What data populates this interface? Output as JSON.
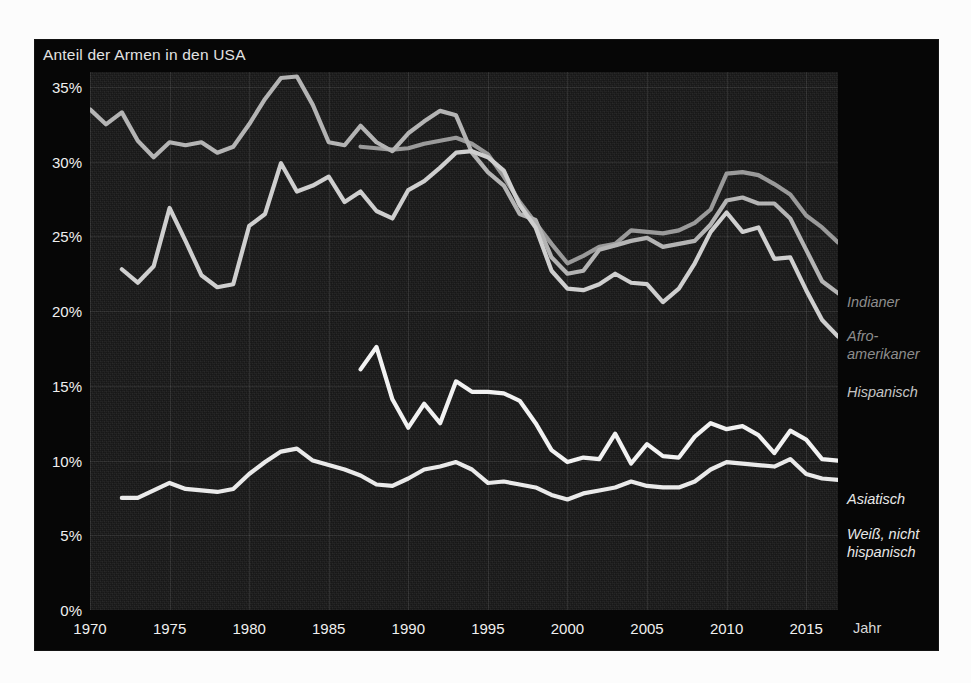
{
  "chart_data": {
    "type": "line",
    "title": "Anteil der Armen in den USA",
    "xlabel": "Jahr",
    "ylabel": "",
    "xlim": [
      1970,
      2017
    ],
    "ylim": [
      0,
      36
    ],
    "grid": true,
    "legend_position": "right",
    "ytick_labels": [
      "0%",
      "5%",
      "10%",
      "15%",
      "20%",
      "25%",
      "30%",
      "35%"
    ],
    "ytick_values": [
      0,
      5,
      10,
      15,
      20,
      25,
      30,
      35
    ],
    "xtick_labels": [
      "1970",
      "1975",
      "1980",
      "1985",
      "1990",
      "1995",
      "2000",
      "2005",
      "2010",
      "2015"
    ],
    "xtick_values": [
      1970,
      1975,
      1980,
      1985,
      1990,
      1995,
      2000,
      2005,
      2010,
      2015
    ],
    "series": [
      {
        "name": "Indianer",
        "color": "#9a9a9a",
        "label_color": "#8d8d8d",
        "x": [
          1987,
          1988,
          1989,
          1990,
          1991,
          1992,
          1993,
          1994,
          1995,
          1996,
          1997,
          1998,
          1999,
          2000,
          2001,
          2002,
          2003,
          2004,
          2005,
          2006,
          2007,
          2008,
          2009,
          2010,
          2011,
          2012,
          2013,
          2014,
          2015,
          2016,
          2017
        ],
        "values": [
          31.0,
          30.9,
          30.8,
          30.9,
          31.2,
          31.4,
          31.6,
          31.2,
          30.5,
          29.0,
          27.3,
          25.9,
          24.5,
          23.2,
          23.7,
          24.3,
          24.5,
          25.4,
          25.3,
          25.2,
          25.4,
          25.9,
          26.8,
          29.2,
          29.3,
          29.1,
          28.5,
          27.8,
          26.4,
          25.6,
          24.6
        ]
      },
      {
        "name": "Afro-amerikaner",
        "color": "#b4b4b4",
        "label_color": "#8d8d8d",
        "x": [
          1970,
          1971,
          1972,
          1973,
          1974,
          1975,
          1976,
          1977,
          1978,
          1979,
          1980,
          1981,
          1982,
          1983,
          1984,
          1985,
          1986,
          1987,
          1988,
          1989,
          1990,
          1991,
          1992,
          1993,
          1994,
          1995,
          1996,
          1997,
          1998,
          1999,
          2000,
          2001,
          2002,
          2003,
          2004,
          2005,
          2006,
          2007,
          2008,
          2009,
          2010,
          2011,
          2012,
          2013,
          2014,
          2015,
          2016,
          2017
        ],
        "values": [
          33.5,
          32.5,
          33.3,
          31.4,
          30.3,
          31.3,
          31.1,
          31.3,
          30.6,
          31.0,
          32.5,
          34.2,
          35.6,
          35.7,
          33.8,
          31.3,
          31.1,
          32.4,
          31.3,
          30.7,
          31.9,
          32.7,
          33.4,
          33.1,
          30.6,
          29.3,
          28.4,
          26.5,
          26.1,
          23.6,
          22.5,
          22.7,
          24.1,
          24.4,
          24.7,
          24.9,
          24.3,
          24.5,
          24.7,
          25.8,
          27.4,
          27.6,
          27.2,
          27.2,
          26.2,
          24.1,
          22.0,
          21.2
        ]
      },
      {
        "name": "Hispanisch",
        "color": "#cfcfcf",
        "label_color": "#c4c4c4",
        "x": [
          1972,
          1973,
          1974,
          1975,
          1976,
          1977,
          1978,
          1979,
          1980,
          1981,
          1982,
          1983,
          1984,
          1985,
          1986,
          1987,
          1988,
          1989,
          1990,
          1991,
          1992,
          1993,
          1994,
          1995,
          1996,
          1997,
          1998,
          1999,
          2000,
          2001,
          2002,
          2003,
          2004,
          2005,
          2006,
          2007,
          2008,
          2009,
          2010,
          2011,
          2012,
          2013,
          2014,
          2015,
          2016,
          2017
        ],
        "values": [
          22.8,
          21.9,
          23.0,
          26.9,
          24.7,
          22.4,
          21.6,
          21.8,
          25.7,
          26.5,
          29.9,
          28.0,
          28.4,
          29.0,
          27.3,
          28.0,
          26.7,
          26.2,
          28.1,
          28.7,
          29.6,
          30.6,
          30.7,
          30.3,
          29.4,
          27.1,
          25.6,
          22.7,
          21.5,
          21.4,
          21.8,
          22.5,
          21.9,
          21.8,
          20.6,
          21.5,
          23.2,
          25.3,
          26.6,
          25.3,
          25.6,
          23.5,
          23.6,
          21.4,
          19.4,
          18.3
        ]
      },
      {
        "name": "Asiatisch",
        "color": "#f2f2f2",
        "label_color": "#e8e8e8",
        "x": [
          1987,
          1988,
          1989,
          1990,
          1991,
          1992,
          1993,
          1994,
          1995,
          1996,
          1997,
          1998,
          1999,
          2000,
          2001,
          2002,
          2003,
          2004,
          2005,
          2006,
          2007,
          2008,
          2009,
          2010,
          2011,
          2012,
          2013,
          2014,
          2015,
          2016,
          2017
        ],
        "values": [
          16.1,
          17.6,
          14.1,
          12.2,
          13.8,
          12.5,
          15.3,
          14.6,
          14.6,
          14.5,
          14.0,
          12.5,
          10.7,
          9.9,
          10.2,
          10.1,
          11.8,
          9.8,
          11.1,
          10.3,
          10.2,
          11.6,
          12.5,
          12.1,
          12.3,
          11.7,
          10.5,
          12.0,
          11.4,
          10.1,
          10.0
        ]
      },
      {
        "name": "Weiß, nicht hispanisch",
        "color": "#eaeaea",
        "label_color": "#e8e8e8",
        "x": [
          1972,
          1973,
          1974,
          1975,
          1976,
          1977,
          1978,
          1979,
          1980,
          1981,
          1982,
          1983,
          1984,
          1985,
          1986,
          1987,
          1988,
          1989,
          1990,
          1991,
          1992,
          1993,
          1994,
          1995,
          1996,
          1997,
          1998,
          1999,
          2000,
          2001,
          2002,
          2003,
          2004,
          2005,
          2006,
          2007,
          2008,
          2009,
          2010,
          2011,
          2012,
          2013,
          2014,
          2015,
          2016,
          2017
        ],
        "values": [
          7.5,
          7.5,
          8.0,
          8.5,
          8.1,
          8.0,
          7.9,
          8.1,
          9.1,
          9.9,
          10.6,
          10.8,
          10.0,
          9.7,
          9.4,
          9.0,
          8.4,
          8.3,
          8.8,
          9.4,
          9.6,
          9.9,
          9.4,
          8.5,
          8.6,
          8.4,
          8.2,
          7.7,
          7.4,
          7.8,
          8.0,
          8.2,
          8.6,
          8.3,
          8.2,
          8.2,
          8.6,
          9.4,
          9.9,
          9.8,
          9.7,
          9.6,
          10.1,
          9.1,
          8.8,
          8.7
        ]
      }
    ]
  },
  "legend": [
    {
      "label": "Indianer",
      "top": 253,
      "color": "#8d8d8d"
    },
    {
      "label": "Afro-\namerikaner",
      "top": 287,
      "color": "#8d8d8d"
    },
    {
      "label": "Hispanisch",
      "top": 343,
      "color": "#c4c4c4"
    },
    {
      "label": "Asiatisch",
      "top": 450,
      "color": "#e8e8e8"
    },
    {
      "label": "Weiß, nicht\nhispanisch",
      "top": 485,
      "color": "#e8e8e8"
    }
  ]
}
